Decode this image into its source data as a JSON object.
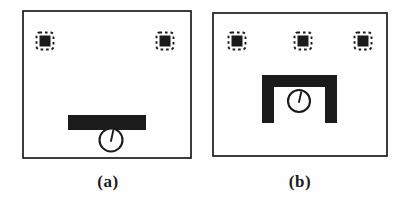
{
  "figure": {
    "background": "#fefefe",
    "ink": "#1b1b1b",
    "icons": {
      "landmark": "dashed-square-with-filled-square-icon",
      "robot": "circle-with-heading-line-icon",
      "obstacle": "filled-black-region"
    },
    "landmark_style": {
      "outer_size": 17,
      "inner_size": 11
    },
    "panels": [
      {
        "caption": "(a)",
        "caption_cx": 108,
        "caption_top": 172,
        "box": {
          "x": 23,
          "y": 11,
          "w": 168,
          "h": 147
        },
        "landmarks": [
          {
            "cx": 45,
            "cy": 41
          },
          {
            "cx": 165,
            "cy": 41
          }
        ],
        "obstacles": [
          {
            "shape": "bar",
            "x": 68,
            "y": 115,
            "w": 78,
            "h": 15
          }
        ],
        "robot": {
          "cx": 111,
          "cy": 140,
          "r": 11.5
        }
      },
      {
        "caption": "(b)",
        "caption_cx": 300,
        "caption_top": 172,
        "box": {
          "x": 213,
          "y": 13,
          "w": 174,
          "h": 143
        },
        "landmarks": [
          {
            "cx": 237,
            "cy": 41
          },
          {
            "cx": 303,
            "cy": 41
          },
          {
            "cx": 363,
            "cy": 41
          }
        ],
        "obstacles": [
          {
            "shape": "u",
            "x": 262,
            "y": 75,
            "w": 75,
            "h": 48,
            "t": 12
          }
        ],
        "robot": {
          "cx": 299,
          "cy": 101,
          "r": 11
        }
      }
    ]
  }
}
